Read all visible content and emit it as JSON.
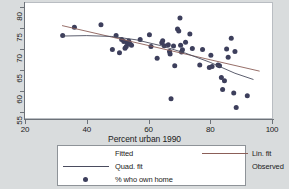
{
  "colors": {
    "page_background": "#d9dcdd",
    "plot_background": "#ffffff",
    "axis": "#6d7279",
    "marker": "#3d3f5c",
    "linear_fit": "#8b5f58",
    "quadratic_fit": "#4a4c5e",
    "legend_border": "#8e9398",
    "text": "#1b1b1b"
  },
  "chart_data": {
    "type": "scatter",
    "title": "",
    "subtitle": "",
    "xlabel": "Percent urban 1990",
    "ylabel": "",
    "xlim": [
      20,
      100
    ],
    "ylim": [
      53.5,
      81
    ],
    "xticks": [
      20,
      40,
      60,
      80,
      100
    ],
    "yticks": [
      55,
      60,
      65,
      70,
      75,
      80
    ],
    "xtick_labels": [
      "20",
      "40",
      "60",
      "80",
      "100"
    ],
    "ytick_labels": [
      "55",
      "60",
      "65",
      "70",
      "75",
      "80"
    ],
    "grid": false,
    "legend_position": "below-axes",
    "legend_title": "Fitted",
    "legend_entries": [
      {
        "label": "Fitted",
        "type": "header"
      },
      {
        "label": "Lin. fit",
        "type": "line",
        "color": "#8b5f58"
      },
      {
        "label": "Quad. fit",
        "type": "line",
        "color": "#4a4c5e"
      },
      {
        "label": "Observed",
        "type": "header"
      },
      {
        "label": "% who own home",
        "type": "marker",
        "color": "#3d3f5c"
      }
    ],
    "series": [
      {
        "name": "% who own home",
        "type": "scatter",
        "marker_color": "#3d3f5c",
        "points": [
          [
            32.2,
            73.2
          ],
          [
            36.0,
            75.2
          ],
          [
            44.6,
            75.8
          ],
          [
            48.3,
            69.9
          ],
          [
            49.5,
            73.2
          ],
          [
            50.6,
            69.1
          ],
          [
            51.3,
            72.3
          ],
          [
            52.0,
            71.8
          ],
          [
            52.4,
            70.2
          ],
          [
            52.8,
            70.6
          ],
          [
            53.1,
            71.5
          ],
          [
            53.6,
            71.9
          ],
          [
            54.0,
            71.2
          ],
          [
            54.5,
            70.9
          ],
          [
            57.3,
            72.3
          ],
          [
            60.3,
            73.4
          ],
          [
            60.8,
            70.6
          ],
          [
            62.8,
            67.8
          ],
          [
            64.3,
            71.5
          ],
          [
            64.6,
            72.0
          ],
          [
            65.1,
            70.8
          ],
          [
            66.4,
            71.0
          ],
          [
            66.8,
            69.4
          ],
          [
            67.0,
            68.8
          ],
          [
            67.3,
            58.1
          ],
          [
            68.1,
            70.7
          ],
          [
            68.5,
            66.0
          ],
          [
            69.4,
            74.8
          ],
          [
            69.8,
            74.3
          ],
          [
            70.2,
            77.4
          ],
          [
            70.4,
            70.9
          ],
          [
            70.7,
            69.3
          ],
          [
            71.0,
            69.8
          ],
          [
            72.0,
            71.6
          ],
          [
            73.4,
            73.6
          ],
          [
            74.2,
            70.1
          ],
          [
            76.6,
            66.2
          ],
          [
            77.5,
            69.9
          ],
          [
            79.7,
            65.6
          ],
          [
            80.2,
            68.5
          ],
          [
            80.6,
            65.8
          ],
          [
            82.5,
            66.2
          ],
          [
            83.0,
            66.0
          ],
          [
            83.6,
            63.2
          ],
          [
            84.0,
            60.3
          ],
          [
            84.6,
            62.4
          ],
          [
            85.3,
            70.0
          ],
          [
            85.8,
            68.0
          ],
          [
            86.8,
            72.6
          ],
          [
            87.6,
            59.5
          ],
          [
            88.0,
            69.4
          ],
          [
            88.4,
            56.0
          ],
          [
            92.0,
            58.8
          ]
        ]
      },
      {
        "name": "Lin. fit",
        "type": "line",
        "color": "#8b5f58",
        "points": [
          [
            32.0,
            75.6
          ],
          [
            96.0,
            64.7
          ]
        ]
      },
      {
        "name": "Quad. fit",
        "type": "line",
        "color": "#4a4c5e",
        "points": [
          [
            32.0,
            73.1
          ],
          [
            40.0,
            73.2
          ],
          [
            48.0,
            73.0
          ],
          [
            56.0,
            72.2
          ],
          [
            64.0,
            70.8
          ],
          [
            72.0,
            69.0
          ],
          [
            80.0,
            66.8
          ],
          [
            88.0,
            64.2
          ],
          [
            94.0,
            62.7
          ]
        ]
      }
    ]
  }
}
